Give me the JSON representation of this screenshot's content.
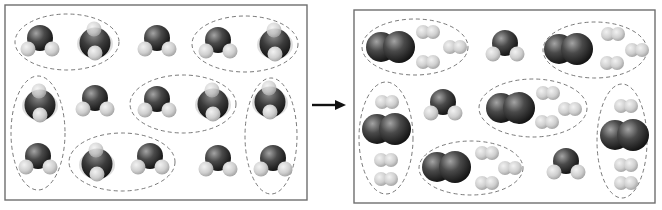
{
  "diagram": {
    "colors": {
      "background": "#ffffff",
      "panel_border": "#6e6e6e",
      "ellipse_dash": "#6a6a6a",
      "oxygen_dark": "#1e1e1e",
      "oxygen_light": "#9a9a9a",
      "hydrogen_dark": "#a8a8a8",
      "hydrogen_light": "#ececec",
      "arrow": "#111111"
    },
    "arrow": {
      "x1": 312,
      "y1": 105,
      "x2": 346,
      "y2": 105,
      "label": "reaction-arrow"
    },
    "panels": [
      {
        "name": "reactants-panel",
        "box": {
          "x": 5,
          "y": 5,
          "w": 302,
          "h": 195
        },
        "h2o": [
          {
            "x": 40,
            "y": 40,
            "view": "side"
          },
          {
            "x": 95,
            "y": 41,
            "view": "front"
          },
          {
            "x": 157,
            "y": 40,
            "view": "side"
          },
          {
            "x": 218,
            "y": 42,
            "view": "side"
          },
          {
            "x": 275,
            "y": 42,
            "view": "front"
          },
          {
            "x": 40,
            "y": 103,
            "view": "front"
          },
          {
            "x": 95,
            "y": 100,
            "view": "side"
          },
          {
            "x": 157,
            "y": 101,
            "view": "side"
          },
          {
            "x": 213,
            "y": 102,
            "view": "front"
          },
          {
            "x": 270,
            "y": 100,
            "view": "front"
          },
          {
            "x": 38,
            "y": 158,
            "view": "side"
          },
          {
            "x": 97,
            "y": 162,
            "view": "front"
          },
          {
            "x": 150,
            "y": 158,
            "view": "side"
          },
          {
            "x": 218,
            "y": 160,
            "view": "side"
          },
          {
            "x": 273,
            "y": 160,
            "view": "side"
          }
        ],
        "o2": [],
        "h2": [],
        "ellipses": [
          {
            "cx": 67,
            "cy": 42,
            "rx": 52,
            "ry": 28
          },
          {
            "cx": 245,
            "cy": 44,
            "rx": 53,
            "ry": 28
          },
          {
            "cx": 38,
            "cy": 133,
            "rx": 27,
            "ry": 57
          },
          {
            "cx": 183,
            "cy": 104,
            "rx": 53,
            "ry": 29
          },
          {
            "cx": 122,
            "cy": 162,
            "rx": 53,
            "ry": 29
          },
          {
            "cx": 271,
            "cy": 136,
            "rx": 26,
            "ry": 58
          }
        ]
      },
      {
        "name": "products-panel",
        "box": {
          "x": 354,
          "y": 10,
          "w": 301,
          "h": 193
        },
        "h2o": [
          {
            "x": 505,
            "y": 45,
            "view": "side"
          },
          {
            "x": 443,
            "y": 104,
            "view": "side"
          },
          {
            "x": 566,
            "y": 163,
            "view": "side"
          }
        ],
        "o2": [
          {
            "x": 390,
            "y": 47
          },
          {
            "x": 568,
            "y": 49
          },
          {
            "x": 386,
            "y": 129
          },
          {
            "x": 510,
            "y": 108
          },
          {
            "x": 446,
            "y": 167
          },
          {
            "x": 624,
            "y": 135
          }
        ],
        "h2": [
          {
            "x": 428,
            "y": 32
          },
          {
            "x": 455,
            "y": 47
          },
          {
            "x": 428,
            "y": 62
          },
          {
            "x": 613,
            "y": 34
          },
          {
            "x": 637,
            "y": 50
          },
          {
            "x": 612,
            "y": 63
          },
          {
            "x": 387,
            "y": 102
          },
          {
            "x": 386,
            "y": 160
          },
          {
            "x": 386,
            "y": 179
          },
          {
            "x": 548,
            "y": 93
          },
          {
            "x": 570,
            "y": 109
          },
          {
            "x": 547,
            "y": 122
          },
          {
            "x": 487,
            "y": 153
          },
          {
            "x": 510,
            "y": 168
          },
          {
            "x": 487,
            "y": 183
          },
          {
            "x": 626,
            "y": 106
          },
          {
            "x": 626,
            "y": 165
          },
          {
            "x": 626,
            "y": 183
          }
        ],
        "ellipses": [
          {
            "cx": 415,
            "cy": 47,
            "rx": 53,
            "ry": 28
          },
          {
            "cx": 595,
            "cy": 50,
            "rx": 52,
            "ry": 28
          },
          {
            "cx": 386,
            "cy": 138,
            "rx": 27,
            "ry": 56
          },
          {
            "cx": 533,
            "cy": 108,
            "rx": 54,
            "ry": 29
          },
          {
            "cx": 471,
            "cy": 168,
            "rx": 52,
            "ry": 27
          },
          {
            "cx": 622,
            "cy": 141,
            "rx": 25,
            "ry": 57
          }
        ]
      }
    ]
  }
}
